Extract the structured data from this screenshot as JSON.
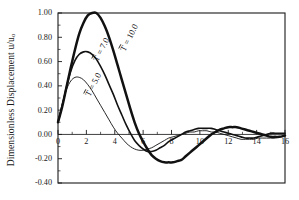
{
  "figure": {
    "y_axis_label_main": "Dimensionless Displacement u/u",
    "y_axis_label_sub": "o"
  },
  "chart_data": {
    "type": "line",
    "xlabel": "",
    "ylabel": "Dimensionless Displacement u/u_o",
    "xlim": [
      0,
      16
    ],
    "ylim": [
      -0.4,
      1.0
    ],
    "xticks": [
      0,
      2,
      4,
      6,
      8,
      10,
      12,
      14,
      16
    ],
    "xtick_labels": [
      "0",
      "2",
      "4",
      "6",
      "8",
      "10",
      "12",
      "14",
      "16"
    ],
    "yticks": [
      -0.4,
      -0.2,
      0.0,
      0.2,
      0.4,
      0.6,
      0.8,
      1.0
    ],
    "ytick_labels": [
      "-0.40",
      "-0.20",
      "0.00",
      "0.20",
      "0.40",
      "0.60",
      "0.80",
      "1.00"
    ],
    "minor_x_ticks": true,
    "grid": false,
    "legend": "inline-curve-labels",
    "series": [
      {
        "name": "T̄ = 10.0",
        "label_text": "T = 10.0",
        "line_weight": "thick",
        "color": "#111111",
        "x": [
          0.0,
          0.3,
          0.6,
          0.9,
          1.2,
          1.5,
          1.8,
          2.1,
          2.4,
          2.7,
          3.0,
          3.3,
          3.6,
          3.9,
          4.2,
          4.5,
          4.8,
          5.1,
          5.4,
          5.7,
          6.0,
          6.3,
          6.6,
          6.9,
          7.2,
          7.5,
          7.8,
          8.1,
          8.4,
          8.7,
          9.0,
          9.3,
          9.6,
          9.9,
          10.2,
          10.5,
          10.8,
          11.1,
          11.4,
          11.7,
          12.0,
          12.3,
          12.6,
          12.9,
          13.2,
          13.5,
          13.8,
          14.1,
          14.4,
          14.7,
          15.0,
          15.3,
          15.6,
          16.0
        ],
        "y": [
          0.1,
          0.23,
          0.39,
          0.55,
          0.7,
          0.83,
          0.92,
          0.98,
          1.0,
          1.0,
          0.96,
          0.89,
          0.8,
          0.69,
          0.57,
          0.45,
          0.33,
          0.21,
          0.1,
          0.01,
          -0.06,
          -0.12,
          -0.17,
          -0.2,
          -0.22,
          -0.23,
          -0.23,
          -0.23,
          -0.22,
          -0.21,
          -0.18,
          -0.15,
          -0.12,
          -0.09,
          -0.06,
          -0.03,
          0.0,
          0.02,
          0.04,
          0.05,
          0.06,
          0.06,
          0.06,
          0.05,
          0.04,
          0.03,
          0.02,
          0.01,
          0.0,
          -0.01,
          -0.02,
          -0.02,
          -0.02,
          -0.01
        ]
      },
      {
        "name": "T̄ = 7.0",
        "label_text": "T = 7.0",
        "line_weight": "medium",
        "color": "#111111",
        "x": [
          0.0,
          0.3,
          0.6,
          0.9,
          1.2,
          1.5,
          1.8,
          2.1,
          2.4,
          2.7,
          3.0,
          3.3,
          3.6,
          3.9,
          4.2,
          4.5,
          4.8,
          5.1,
          5.4,
          5.7,
          6.0,
          6.3,
          6.6,
          6.9,
          7.2,
          7.5,
          7.8,
          8.1,
          8.4,
          8.7,
          9.0,
          9.3,
          9.6,
          9.9,
          10.2,
          10.5,
          10.8,
          11.1,
          11.4,
          11.7,
          12.0,
          12.3,
          12.6,
          12.9,
          13.2,
          13.5,
          13.8,
          14.1,
          14.4,
          14.7,
          15.0,
          15.3,
          15.6,
          16.0
        ],
        "y": [
          0.1,
          0.24,
          0.39,
          0.52,
          0.61,
          0.66,
          0.68,
          0.68,
          0.66,
          0.62,
          0.56,
          0.49,
          0.41,
          0.33,
          0.24,
          0.16,
          0.08,
          0.01,
          -0.05,
          -0.09,
          -0.12,
          -0.14,
          -0.14,
          -0.13,
          -0.11,
          -0.09,
          -0.06,
          -0.04,
          -0.02,
          0.0,
          0.02,
          0.03,
          0.04,
          0.05,
          0.05,
          0.05,
          0.05,
          0.04,
          0.03,
          0.02,
          0.01,
          0.0,
          -0.01,
          -0.02,
          -0.03,
          -0.03,
          -0.03,
          -0.02,
          -0.01,
          0.0,
          0.01,
          0.01,
          0.01,
          0.01
        ]
      },
      {
        "name": "T̄ = 5.0",
        "label_text": "T = 5.0",
        "line_weight": "thin",
        "color": "#111111",
        "x": [
          0.0,
          0.3,
          0.6,
          0.9,
          1.2,
          1.5,
          1.8,
          2.1,
          2.4,
          2.7,
          3.0,
          3.3,
          3.6,
          3.9,
          4.2,
          4.5,
          4.8,
          5.1,
          5.4,
          5.7,
          6.0,
          6.3,
          6.6,
          6.9,
          7.2,
          7.5,
          7.8,
          8.1,
          8.4,
          8.7,
          9.0,
          9.3,
          9.6,
          9.9,
          10.2,
          10.5,
          10.8,
          11.1,
          11.4,
          11.7,
          12.0,
          12.3,
          12.6,
          12.9,
          13.2,
          13.5,
          13.8,
          14.1,
          14.4,
          14.7,
          15.0,
          15.3,
          15.6,
          16.0
        ],
        "y": [
          0.1,
          0.25,
          0.37,
          0.44,
          0.47,
          0.47,
          0.45,
          0.41,
          0.36,
          0.3,
          0.24,
          0.18,
          0.12,
          0.06,
          0.01,
          -0.03,
          -0.07,
          -0.1,
          -0.12,
          -0.13,
          -0.13,
          -0.12,
          -0.11,
          -0.09,
          -0.07,
          -0.05,
          -0.03,
          -0.02,
          -0.01,
          0.0,
          0.01,
          0.02,
          0.02,
          0.03,
          0.03,
          0.03,
          0.02,
          0.02,
          0.01,
          0.0,
          -0.01,
          -0.02,
          -0.03,
          -0.04,
          -0.04,
          -0.04,
          -0.04,
          -0.03,
          -0.03,
          -0.03,
          -0.03,
          -0.03,
          -0.02,
          -0.01
        ]
      }
    ],
    "annotations": [
      {
        "text": "T = 10.0",
        "x_px": 125,
        "y_px": 52,
        "rotation": -63
      },
      {
        "text": "T = 7.0",
        "x_px": 98,
        "y_px": 62,
        "rotation": -63
      },
      {
        "text": "T = 5.0",
        "x_px": 90,
        "y_px": 97,
        "rotation": -63
      }
    ]
  }
}
